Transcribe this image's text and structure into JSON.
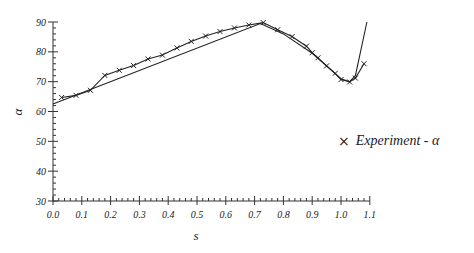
{
  "chart_data": {
    "type": "line",
    "title": "",
    "xlabel": "s",
    "ylabel": "α",
    "xlim": [
      0.0,
      1.1
    ],
    "ylim": [
      30,
      90
    ],
    "x_ticks": [
      "0.0",
      "0.1",
      "0.2",
      "0.3",
      "0.4",
      "0.5",
      "0.6",
      "0.7",
      "0.8",
      "0.9",
      "1.0",
      "1.1"
    ],
    "y_ticks": [
      "30",
      "40",
      "50",
      "60",
      "70",
      "80",
      "90"
    ],
    "grid": false,
    "legend_position": "right",
    "series": [
      {
        "name": "Experiment - α",
        "marker": "x",
        "line": "solid",
        "x": [
          0.03,
          0.08,
          0.13,
          0.18,
          0.23,
          0.28,
          0.33,
          0.38,
          0.43,
          0.48,
          0.53,
          0.58,
          0.63,
          0.68,
          0.73,
          0.78,
          0.83,
          0.88,
          0.9,
          0.92,
          0.95,
          0.98,
          1.0,
          1.03,
          1.05,
          1.08
        ],
        "values": [
          64.7,
          65.4,
          67.1,
          72.1,
          73.8,
          75.4,
          77.6,
          78.9,
          81.3,
          83.5,
          85.3,
          86.8,
          88.0,
          89.0,
          89.8,
          87.4,
          85.1,
          81.9,
          79.7,
          78.0,
          75.3,
          72.8,
          70.7,
          69.9,
          71.2,
          76.0
        ]
      },
      {
        "name": "Model",
        "marker": "none",
        "line": "solid",
        "x": [
          0.0,
          0.72,
          0.8,
          0.9,
          1.0,
          1.03,
          1.05,
          1.09
        ],
        "values": [
          62.5,
          89.5,
          86.0,
          79.5,
          71.0,
          70.0,
          72.0,
          90.0
        ]
      }
    ]
  },
  "legend": {
    "marker": "×",
    "label": "Experiment - α"
  },
  "axes": {
    "xlabel": "s",
    "ylabel": "α"
  }
}
